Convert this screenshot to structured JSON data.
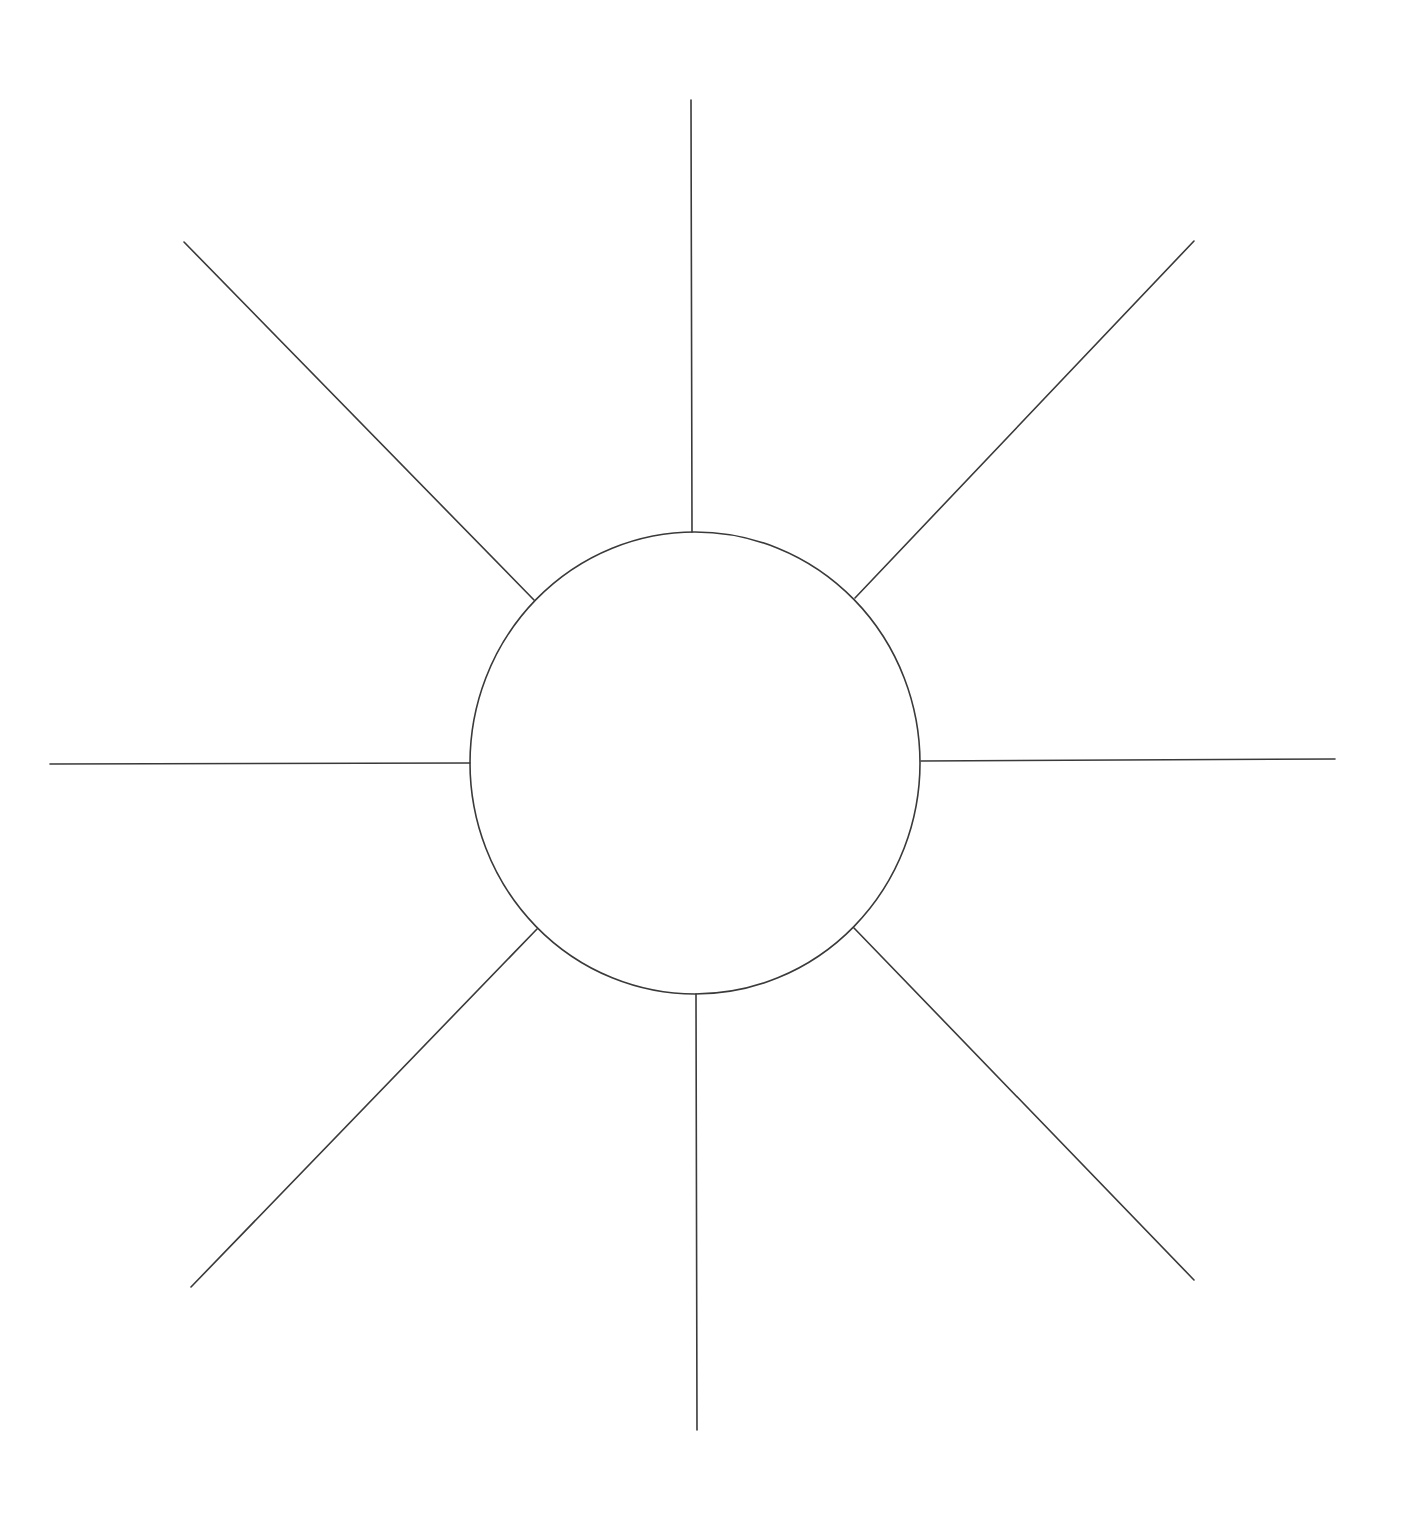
{
  "diagram": {
    "type": "sunburst-web-organizer",
    "labels": [],
    "colors": {
      "background": "#ffffff",
      "stroke": "#3a3a3a"
    },
    "stroke_width": 1.6,
    "center_circle": {
      "cx": 695,
      "cy": 763,
      "rx": 225,
      "ry": 231
    },
    "spokes": [
      {
        "name": "spoke-top",
        "x1": 692,
        "y1": 532,
        "x2": 691,
        "y2": 100
      },
      {
        "name": "spoke-top-right",
        "x1": 855,
        "y1": 598,
        "x2": 1194,
        "y2": 241
      },
      {
        "name": "spoke-right",
        "x1": 921,
        "y1": 761,
        "x2": 1335,
        "y2": 759
      },
      {
        "name": "spoke-bottom-right",
        "x1": 854,
        "y1": 928,
        "x2": 1194,
        "y2": 1280
      },
      {
        "name": "spoke-bottom",
        "x1": 696,
        "y1": 994,
        "x2": 697,
        "y2": 1430
      },
      {
        "name": "spoke-bottom-left",
        "x1": 537,
        "y1": 929,
        "x2": 191,
        "y2": 1287
      },
      {
        "name": "spoke-left",
        "x1": 470,
        "y1": 763,
        "x2": 50,
        "y2": 764
      },
      {
        "name": "spoke-top-left",
        "x1": 534,
        "y1": 600,
        "x2": 184,
        "y2": 242
      }
    ]
  }
}
